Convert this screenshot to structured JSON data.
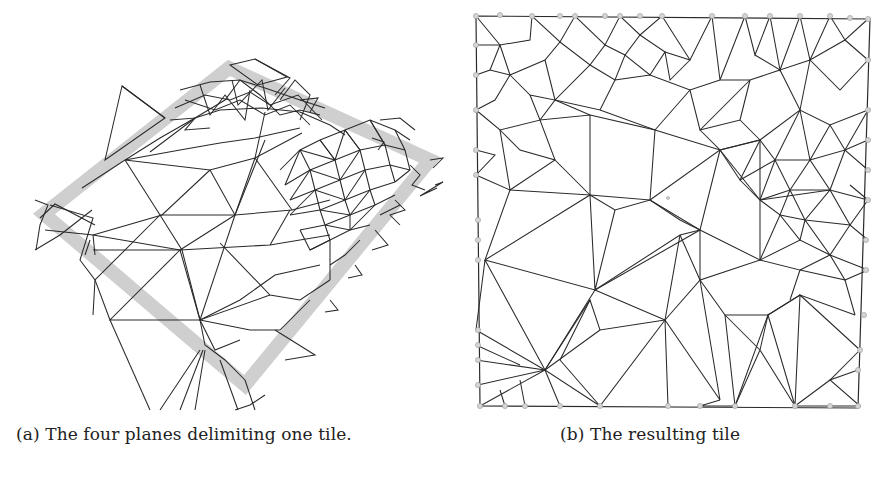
{
  "figure": {
    "panels": [
      {
        "id": "a",
        "label": "(a)",
        "caption": "(a) The four planes delimiting one tile.",
        "description": "3D triangulated mesh with a gray rectangular band showing the four delimiting planes"
      },
      {
        "id": "b",
        "label": "(b)",
        "caption": "(b) The resulting tile",
        "description": "Clipped triangulated tile with boundary vertices marked as gray dots"
      }
    ],
    "colors": {
      "edge": "#2a2a2a",
      "plane_band": "#cfcfcf",
      "boundary_node": "#d4d4d4",
      "background": "#ffffff"
    }
  }
}
